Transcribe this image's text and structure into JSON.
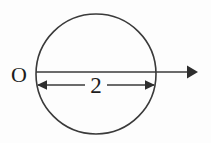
{
  "figure": {
    "background_color": "#fdfdfd",
    "stroke_color": "#3a3a3a",
    "text_color": "#1d1d1d",
    "width": 211,
    "height": 143
  },
  "labels": {
    "origin": "O",
    "diameter_value": "2"
  },
  "geometry": {
    "circle": {
      "center_x": 96,
      "center_y": 74,
      "radius": 60
    },
    "axis": {
      "start_x": 36,
      "end_x": 196,
      "y": 72,
      "arrow_direction": "right"
    },
    "dimension": {
      "left_x": 37,
      "right_x": 155,
      "y": 85,
      "arrow_direction": "both"
    }
  },
  "icons": {
    "axis_arrowhead": "arrow-right-solid",
    "dim_left_arrowhead": "arrow-left-solid",
    "dim_right_arrowhead": "arrow-right-solid"
  }
}
